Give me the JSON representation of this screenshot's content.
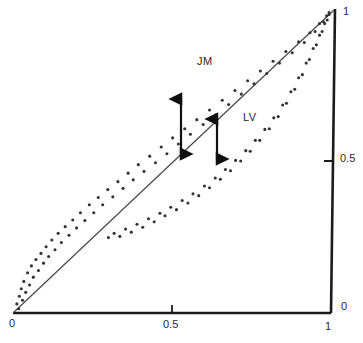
{
  "figure": {
    "background": "#ffffff",
    "ink": "#1b1b1b",
    "line_color": "#4a4a4a",
    "dot_color": "#333333"
  },
  "axes": {
    "x_axis_name": "bottom-axis",
    "y_axis_name": "right-axis",
    "x_ticks": [
      {
        "value": 0,
        "label": "0",
        "pixel": 13
      },
      {
        "value": 0.5,
        "label": "0.5",
        "pixel": 172
      },
      {
        "value": 1,
        "label": "1",
        "pixel": 331
      }
    ],
    "y_ticks": [
      {
        "value": 0,
        "label": "0",
        "pixel": 313
      },
      {
        "value": 0.5,
        "label": "0.5",
        "pixel": 161
      },
      {
        "value": 1,
        "label": "1",
        "pixel": 9
      }
    ]
  },
  "annotations": {
    "series_labels": [
      {
        "name": "jm-label",
        "text": "JM",
        "x": 197,
        "y": 55
      },
      {
        "name": "lv-label",
        "text": "LV",
        "x": 243,
        "y": 111
      }
    ],
    "arrows": [
      {
        "name": "gap-arrow-jm",
        "x": 181,
        "y_top": 97,
        "y_bottom": 156,
        "double_headed": true
      },
      {
        "name": "gap-arrow-lv",
        "x": 217,
        "y_top": 117,
        "y_bottom": 161,
        "double_headed": true
      }
    ]
  },
  "chart_data": {
    "type": "scatter",
    "title": "",
    "xlabel": "",
    "ylabel": "",
    "xlim": [
      0,
      1
    ],
    "ylim": [
      0,
      1
    ],
    "grid": false,
    "legend": "inline-labels",
    "reference_line": {
      "name": "diagonal-45",
      "from": [
        0,
        0
      ],
      "to": [
        1,
        1
      ],
      "style": "solid"
    },
    "series": [
      {
        "name": "JM",
        "description": "scatter band lying above the 45-degree diagonal",
        "points": [
          [
            0.012,
            0.03
          ],
          [
            0.018,
            0.014
          ],
          [
            0.02,
            0.055
          ],
          [
            0.026,
            0.08
          ],
          [
            0.03,
            0.042
          ],
          [
            0.034,
            0.104
          ],
          [
            0.04,
            0.068
          ],
          [
            0.046,
            0.132
          ],
          [
            0.052,
            0.092
          ],
          [
            0.058,
            0.155
          ],
          [
            0.064,
            0.118
          ],
          [
            0.072,
            0.176
          ],
          [
            0.08,
            0.14
          ],
          [
            0.088,
            0.196
          ],
          [
            0.096,
            0.164
          ],
          [
            0.104,
            0.218
          ],
          [
            0.112,
            0.186
          ],
          [
            0.122,
            0.24
          ],
          [
            0.132,
            0.208
          ],
          [
            0.142,
            0.262
          ],
          [
            0.152,
            0.232
          ],
          [
            0.164,
            0.284
          ],
          [
            0.176,
            0.256
          ],
          [
            0.188,
            0.306
          ],
          [
            0.2,
            0.28
          ],
          [
            0.212,
            0.33
          ],
          [
            0.226,
            0.304
          ],
          [
            0.24,
            0.356
          ],
          [
            0.254,
            0.33
          ],
          [
            0.268,
            0.38
          ],
          [
            0.282,
            0.356
          ],
          [
            0.298,
            0.406
          ],
          [
            0.314,
            0.382
          ],
          [
            0.33,
            0.432
          ],
          [
            0.346,
            0.41
          ],
          [
            0.362,
            0.46
          ],
          [
            0.378,
            0.438
          ],
          [
            0.394,
            0.488
          ],
          [
            0.412,
            0.466
          ],
          [
            0.43,
            0.516
          ],
          [
            0.448,
            0.494
          ],
          [
            0.466,
            0.546
          ],
          [
            0.484,
            0.524
          ],
          [
            0.502,
            0.576
          ],
          [
            0.52,
            0.556
          ],
          [
            0.54,
            0.606
          ],
          [
            0.558,
            0.588
          ],
          [
            0.578,
            0.636
          ],
          [
            0.598,
            0.62
          ],
          [
            0.618,
            0.668
          ],
          [
            0.638,
            0.652
          ],
          [
            0.658,
            0.7
          ],
          [
            0.678,
            0.686
          ],
          [
            0.698,
            0.732
          ],
          [
            0.718,
            0.72
          ],
          [
            0.738,
            0.764
          ],
          [
            0.758,
            0.754
          ],
          [
            0.778,
            0.796
          ],
          [
            0.798,
            0.788
          ],
          [
            0.818,
            0.828
          ],
          [
            0.838,
            0.822
          ],
          [
            0.858,
            0.86
          ],
          [
            0.878,
            0.856
          ],
          [
            0.898,
            0.892
          ],
          [
            0.916,
            0.89
          ],
          [
            0.934,
            0.922
          ],
          [
            0.95,
            0.926
          ],
          [
            0.964,
            0.952
          ],
          [
            0.976,
            0.958
          ],
          [
            0.986,
            0.978
          ],
          [
            0.994,
            0.988
          ]
        ]
      },
      {
        "name": "LV",
        "description": "scatter band lying below the 45-degree diagonal",
        "points": [
          [
            0.3,
            0.248
          ],
          [
            0.318,
            0.262
          ],
          [
            0.336,
            0.252
          ],
          [
            0.354,
            0.276
          ],
          [
            0.372,
            0.266
          ],
          [
            0.39,
            0.292
          ],
          [
            0.408,
            0.282
          ],
          [
            0.426,
            0.31
          ],
          [
            0.444,
            0.3
          ],
          [
            0.462,
            0.328
          ],
          [
            0.478,
            0.32
          ],
          [
            0.496,
            0.348
          ],
          [
            0.514,
            0.34
          ],
          [
            0.532,
            0.37
          ],
          [
            0.55,
            0.362
          ],
          [
            0.566,
            0.392
          ],
          [
            0.584,
            0.386
          ],
          [
            0.602,
            0.418
          ],
          [
            0.618,
            0.412
          ],
          [
            0.636,
            0.444
          ],
          [
            0.652,
            0.44
          ],
          [
            0.668,
            0.472
          ],
          [
            0.684,
            0.468
          ],
          [
            0.7,
            0.502
          ],
          [
            0.716,
            0.5
          ],
          [
            0.732,
            0.534
          ],
          [
            0.746,
            0.532
          ],
          [
            0.762,
            0.568
          ],
          [
            0.776,
            0.568
          ],
          [
            0.792,
            0.604
          ],
          [
            0.806,
            0.606
          ],
          [
            0.82,
            0.642
          ],
          [
            0.834,
            0.646
          ],
          [
            0.848,
            0.684
          ],
          [
            0.86,
            0.69
          ],
          [
            0.874,
            0.728
          ],
          [
            0.886,
            0.736
          ],
          [
            0.898,
            0.774
          ],
          [
            0.91,
            0.784
          ],
          [
            0.922,
            0.822
          ],
          [
            0.932,
            0.834
          ],
          [
            0.944,
            0.87
          ],
          [
            0.954,
            0.882
          ],
          [
            0.964,
            0.914
          ],
          [
            0.972,
            0.926
          ],
          [
            0.98,
            0.952
          ],
          [
            0.988,
            0.964
          ],
          [
            0.994,
            0.982
          ]
        ]
      }
    ]
  }
}
